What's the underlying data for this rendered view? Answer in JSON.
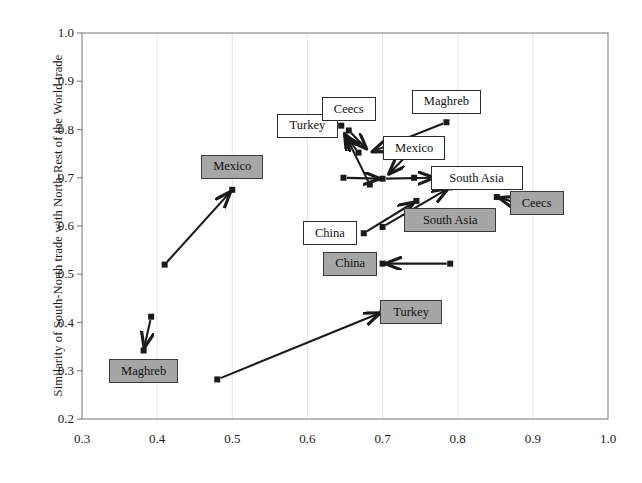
{
  "figure": {
    "type": "scatter-with-arrows",
    "background": "#ffffff",
    "frame_color": "#808080",
    "gridline_color": "#e8e8e8",
    "marker_color": "#1a1a1a",
    "arrow_color": "#1a1a1a",
    "box_white_fill": "#ffffff",
    "box_gray_fill": "#a6a6a6",
    "box_border": "#2b2b2b"
  },
  "chart_data": {
    "type": "scatter",
    "title": "",
    "xlabel": "",
    "ylabel": "Similarity of South-North trade with North-Rest of the World trade",
    "xlim": [
      0.3,
      1.0
    ],
    "ylim": [
      0.2,
      1.0
    ],
    "xticks": [
      "0.3",
      "0.4",
      "0.5",
      "0.6",
      "0.7",
      "0.8",
      "0.9",
      "1.0"
    ],
    "xtick_values": [
      0.3,
      0.4,
      0.5,
      0.6,
      0.7,
      0.8,
      0.9,
      1.0
    ],
    "yticks": [
      "0.2",
      "0.3",
      "0.4",
      "0.5",
      "0.6",
      "0.7",
      "0.8",
      "0.9",
      "1.0"
    ],
    "ytick_values": [
      0.2,
      0.3,
      0.4,
      0.5,
      0.6,
      0.7,
      0.8,
      0.9,
      1.0
    ],
    "grid": "vertical-only",
    "legend": "none",
    "points": [
      {
        "name": "mexico-start",
        "x": 0.41,
        "y": 0.52
      },
      {
        "name": "mexico-end",
        "x": 0.5,
        "y": 0.675
      },
      {
        "name": "maghreb-start",
        "x": 0.392,
        "y": 0.412
      },
      {
        "name": "maghreb-end",
        "x": 0.382,
        "y": 0.342
      },
      {
        "name": "turkey-start",
        "x": 0.48,
        "y": 0.282
      },
      {
        "name": "turkey-end",
        "x": 0.7,
        "y": 0.422
      },
      {
        "name": "china-start",
        "x": 0.79,
        "y": 0.522
      },
      {
        "name": "china-end",
        "x": 0.7,
        "y": 0.522
      },
      {
        "name": "ceecs-gray-start",
        "x": 0.878,
        "y": 0.648
      },
      {
        "name": "ceecs-gray-end",
        "x": 0.852,
        "y": 0.66
      },
      {
        "name": "southasia-start",
        "x": 0.7,
        "y": 0.598
      },
      {
        "name": "southasia-end",
        "x": 0.79,
        "y": 0.68
      },
      {
        "name": "china-white-start",
        "x": 0.675,
        "y": 0.585
      },
      {
        "name": "china-white-end",
        "x": 0.745,
        "y": 0.652
      },
      {
        "name": "maghreb-white",
        "x": 0.785,
        "y": 0.815
      },
      {
        "name": "ceecs-white",
        "x": 0.655,
        "y": 0.798
      },
      {
        "name": "ceecs-white-low",
        "x": 0.668,
        "y": 0.752
      },
      {
        "name": "turkey-white",
        "x": 0.645,
        "y": 0.808
      },
      {
        "name": "mexico-white",
        "x": 0.742,
        "y": 0.762
      },
      {
        "name": "cluster-a",
        "x": 0.648,
        "y": 0.7
      },
      {
        "name": "cluster-b",
        "x": 0.683,
        "y": 0.686
      },
      {
        "name": "cluster-c",
        "x": 0.742,
        "y": 0.7
      },
      {
        "name": "cluster-d",
        "x": 0.7,
        "y": 0.698
      },
      {
        "name": "southasia-white",
        "x": 0.778,
        "y": 0.7
      }
    ],
    "arrows": [
      {
        "name": "arrow-to-mexico-gray",
        "from": [
          0.41,
          0.52
        ],
        "to": [
          0.5,
          0.675
        ]
      },
      {
        "name": "arrow-to-maghreb-gray",
        "from": [
          0.392,
          0.412
        ],
        "to": [
          0.382,
          0.342
        ]
      },
      {
        "name": "arrow-to-turkey-gray",
        "from": [
          0.48,
          0.282
        ],
        "to": [
          0.7,
          0.422
        ]
      },
      {
        "name": "arrow-to-china-gray",
        "from": [
          0.79,
          0.522
        ],
        "to": [
          0.7,
          0.522
        ]
      },
      {
        "name": "arrow-to-ceecs-gray",
        "from": [
          0.878,
          0.648
        ],
        "to": [
          0.852,
          0.66
        ]
      },
      {
        "name": "arrow-to-southasia-gray",
        "from": [
          0.7,
          0.598
        ],
        "to": [
          0.79,
          0.68
        ]
      },
      {
        "name": "arrow-china-white-up",
        "from": [
          0.675,
          0.585
        ],
        "to": [
          0.745,
          0.652
        ]
      },
      {
        "name": "arrow-maghreb-to-hub",
        "from": [
          0.785,
          0.815
        ],
        "to": [
          0.683,
          0.752
        ]
      },
      {
        "name": "arrow-ceecs-to-hub",
        "from": [
          0.655,
          0.798
        ],
        "to": [
          0.681,
          0.756
        ]
      },
      {
        "name": "arrow-low-to-turkey",
        "from": [
          0.668,
          0.752
        ],
        "to": [
          0.648,
          0.792
        ]
      },
      {
        "name": "arrow-clusterb-turkey",
        "from": [
          0.683,
          0.686
        ],
        "to": [
          0.648,
          0.796
        ]
      },
      {
        "name": "arrow-clustera-hub",
        "from": [
          0.648,
          0.7
        ],
        "to": [
          0.7,
          0.698
        ]
      },
      {
        "name": "arrow-hub-southasia",
        "from": [
          0.7,
          0.698
        ],
        "to": [
          0.772,
          0.7
        ]
      },
      {
        "name": "arrow-mexico-hub",
        "from": [
          0.742,
          0.762
        ],
        "to": [
          0.706,
          0.704
        ]
      }
    ]
  },
  "labels": {
    "gray_boxes": [
      {
        "name": "box-gray-mexico",
        "text": "Mexico",
        "x": 0.5,
        "y": 0.723
      },
      {
        "name": "box-gray-maghreb",
        "text": "Maghreb",
        "x": 0.382,
        "y": 0.3
      },
      {
        "name": "box-gray-turkey",
        "text": "Turkey",
        "x": 0.738,
        "y": 0.422
      },
      {
        "name": "box-gray-china",
        "text": "China",
        "x": 0.657,
        "y": 0.522
      },
      {
        "name": "box-gray-southasia",
        "text": "South Asia",
        "x": 0.79,
        "y": 0.612
      },
      {
        "name": "box-gray-ceecs",
        "text": "Ceecs",
        "x": 0.905,
        "y": 0.648
      }
    ],
    "white_boxes": [
      {
        "name": "box-white-turkey",
        "text": "Turkey",
        "x": 0.6,
        "y": 0.808
      },
      {
        "name": "box-white-ceecs",
        "text": "Ceecs",
        "x": 0.655,
        "y": 0.843
      },
      {
        "name": "box-white-maghreb",
        "text": "Maghreb",
        "x": 0.785,
        "y": 0.858
      },
      {
        "name": "box-white-mexico",
        "text": "Mexico",
        "x": 0.742,
        "y": 0.762
      },
      {
        "name": "box-white-southasia",
        "text": "South Asia",
        "x": 0.825,
        "y": 0.7
      },
      {
        "name": "box-white-china",
        "text": "China",
        "x": 0.63,
        "y": 0.585
      }
    ]
  }
}
